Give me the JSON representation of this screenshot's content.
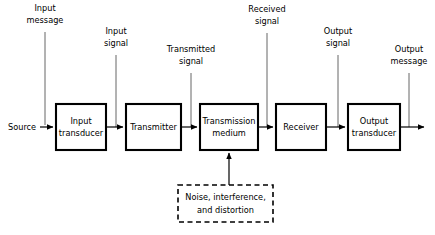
{
  "diagram": {
    "source_label": "Source",
    "blocks": [
      {
        "name": "input-transducer",
        "line1": "Input",
        "line2": "transducer",
        "x": 56,
        "y": 104,
        "w": 50,
        "h": 46,
        "style": "solid"
      },
      {
        "name": "transmitter",
        "line1": "Transmitter",
        "line2": "",
        "x": 126,
        "y": 104,
        "w": 55,
        "h": 46,
        "style": "solid"
      },
      {
        "name": "transmission-medium",
        "line1": "Transmission",
        "line2": "medium",
        "x": 200,
        "y": 104,
        "w": 58,
        "h": 46,
        "style": "solid"
      },
      {
        "name": "receiver",
        "line1": "Receiver",
        "line2": "",
        "x": 276,
        "y": 104,
        "w": 50,
        "h": 46,
        "style": "solid"
      },
      {
        "name": "output-transducer",
        "line1": "Output",
        "line2": "transducer",
        "x": 348,
        "y": 104,
        "w": 52,
        "h": 46,
        "style": "solid"
      },
      {
        "name": "noise-block",
        "line1": "Noise, interference,",
        "line2": "and distortion",
        "x": 178,
        "y": 185,
        "w": 95,
        "h": 37,
        "style": "dashed"
      }
    ],
    "leader_labels": [
      {
        "name": "input-message",
        "line1": "Input",
        "line2": "message",
        "x": 45,
        "label_y": 14,
        "line_top": 32,
        "line_bottom": 125
      },
      {
        "name": "input-signal",
        "line1": "Input",
        "line2": "signal",
        "x": 116,
        "label_y": 37,
        "line_top": 55,
        "line_bottom": 127
      },
      {
        "name": "transmitted-signal",
        "line1": "Transmitted",
        "line2": "signal",
        "x": 191,
        "label_y": 55,
        "line_top": 73,
        "line_bottom": 127
      },
      {
        "name": "received-signal",
        "line1": "Received",
        "line2": "signal",
        "x": 267,
        "label_y": 15,
        "line_top": 33,
        "line_bottom": 127
      },
      {
        "name": "output-signal",
        "line1": "Output",
        "line2": "signal",
        "x": 338,
        "label_y": 37,
        "line_top": 55,
        "line_bottom": 127
      },
      {
        "name": "output-message",
        "line1": "Output",
        "line2": "message",
        "x": 409,
        "label_y": 55,
        "line_top": 73,
        "line_bottom": 127
      }
    ],
    "colors": {
      "ink": "#000000",
      "leader": "#555555",
      "background": "#ffffff"
    }
  }
}
